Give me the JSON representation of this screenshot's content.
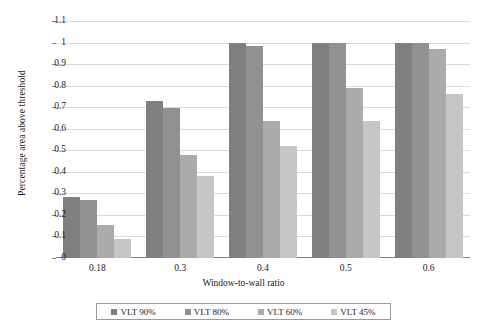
{
  "chart_data": {
    "type": "bar",
    "title": "",
    "xlabel": "Window-to-wall ratio",
    "ylabel": "Percentage area above threshold",
    "categories": [
      "0.18",
      "0.3",
      "0.4",
      "0.5",
      "0.6"
    ],
    "ylim": [
      0,
      1.1
    ],
    "ytick_labels": [
      "1.1",
      "1",
      "0.9",
      "0.8",
      "0.7",
      "0.6",
      "0.5",
      "0.4",
      "0.3",
      "0.2",
      "0.1",
      "0"
    ],
    "ytick_values": [
      1.1,
      1.0,
      0.9,
      0.8,
      0.7,
      0.6,
      0.5,
      0.4,
      0.3,
      0.2,
      0.1,
      0
    ],
    "grid": true,
    "legend_position": "bottom",
    "series": [
      {
        "name": "VLT 90%",
        "color": "#7f7f7f",
        "values": [
          0.285,
          0.73,
          1.0,
          1.0,
          1.0
        ]
      },
      {
        "name": "VLT 80%",
        "color": "#919191",
        "values": [
          0.27,
          0.695,
          0.985,
          1.0,
          1.0
        ]
      },
      {
        "name": "VLT 60%",
        "color": "#ababab",
        "values": [
          0.155,
          0.48,
          0.635,
          0.79,
          0.97
        ]
      },
      {
        "name": "VLT 45%",
        "color": "#c6c6c6",
        "values": [
          0.09,
          0.38,
          0.52,
          0.635,
          0.76
        ]
      }
    ]
  }
}
